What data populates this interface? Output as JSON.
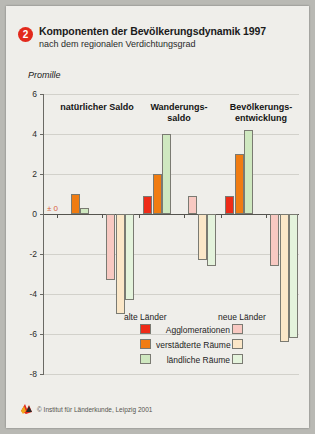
{
  "header": {
    "badge": "2",
    "title": "Komponenten der Bevölkerungsdynamik 1997",
    "subtitle": "nach dem regionalen Verdichtungsgrad"
  },
  "footer": {
    "copyright": "© Institut für Länderkunde, Leipzig 2001",
    "logo_icon": "ifl-logo-icon"
  },
  "legend": {
    "head_old": "alte Länder",
    "head_new": "neue Länder",
    "rows": [
      {
        "label": "Agglomerationen",
        "old_color": "#ee2b18",
        "new_color": "#f8c9c2"
      },
      {
        "label": "verstädterte Räume",
        "old_color": "#f07c12",
        "new_color": "#fbe7c8"
      },
      {
        "label": "ländliche Räume",
        "old_color": "#cfe8c0",
        "new_color": "#e4f3dc"
      }
    ]
  },
  "chart_data": {
    "type": "bar",
    "title": "Komponenten der Bevölkerungsdynamik 1997",
    "subtitle": "nach dem regionalen Verdichtungsgrad",
    "ylabel": "Promille",
    "xlabel": "",
    "ylim": [
      -8,
      6
    ],
    "yticks": [
      6,
      4,
      2,
      0,
      -2,
      -4,
      -6,
      -8
    ],
    "ytick_labels": [
      "6",
      "4",
      "2",
      "0",
      "-2",
      "-4",
      "-6",
      "-8"
    ],
    "grid": true,
    "zero_annotation": "± 0",
    "legend_position": "bottom",
    "categories": [
      "natürlicher Saldo",
      "Wanderungs-\nsaldo",
      "Bevölkerungs-\nentwicklung"
    ],
    "region_groups": [
      "alte Länder",
      "neue Länder"
    ],
    "series": [
      {
        "name": "Agglomerationen",
        "region": "alte Länder",
        "color": "#ee2b18",
        "values": [
          0.0,
          0.9,
          0.9
        ]
      },
      {
        "name": "verstädterte Räume",
        "region": "alte Länder",
        "color": "#f07c12",
        "values": [
          1.0,
          2.0,
          3.0
        ]
      },
      {
        "name": "ländliche Räume",
        "region": "alte Länder",
        "color": "#cfe8c0",
        "values": [
          0.3,
          4.0,
          4.2
        ]
      },
      {
        "name": "Agglomerationen",
        "region": "neue Länder",
        "color": "#f8c9c2",
        "values": [
          -3.3,
          0.9,
          -2.6
        ]
      },
      {
        "name": "verstädterte Räume",
        "region": "neue Länder",
        "color": "#fbe7c8",
        "values": [
          -5.0,
          -2.3,
          -6.4
        ]
      },
      {
        "name": "ländliche Räume",
        "region": "neue Länder",
        "color": "#e4f3dc",
        "values": [
          -4.3,
          -2.6,
          -6.2
        ]
      }
    ]
  }
}
